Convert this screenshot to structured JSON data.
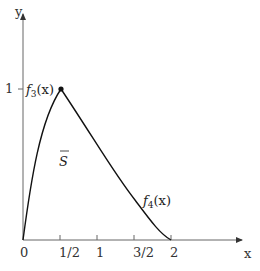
{
  "diagram": {
    "axes": {
      "x_label": "x",
      "y_label": "y",
      "x_ticks": [
        {
          "label": "0",
          "value": 0
        },
        {
          "label": "1/2",
          "value": 0.5
        },
        {
          "label": "1",
          "value": 1
        },
        {
          "label": "3/2",
          "value": 1.5
        },
        {
          "label": "2",
          "value": 2
        }
      ],
      "y_ticks": [
        {
          "label": "1",
          "value": 1
        }
      ]
    },
    "curves": [
      {
        "name": "f3",
        "label_base": "f",
        "label_sub": "3",
        "label_arg": "(x)",
        "from": [
          0,
          0
        ],
        "to": [
          0.5,
          1
        ]
      },
      {
        "name": "f4",
        "label_base": "f",
        "label_sub": "4",
        "label_arg": "(x)",
        "from": [
          0.5,
          1
        ],
        "to": [
          2,
          0
        ]
      }
    ],
    "peak_point": [
      0.5,
      1
    ],
    "region_label": "S",
    "colors": {
      "axis": "#555555",
      "curve": "#111111",
      "text": "#333333",
      "background": "#ffffff"
    }
  }
}
